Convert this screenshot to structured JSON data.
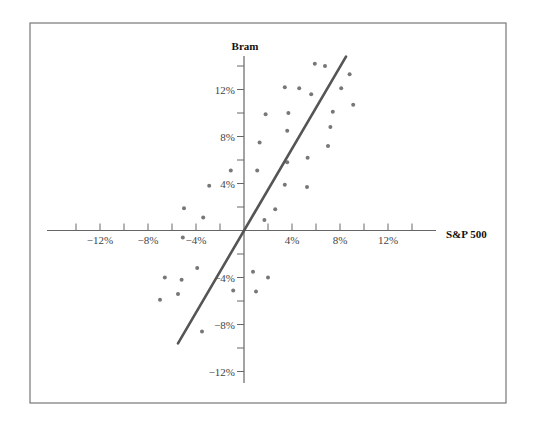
{
  "chart_data": {
    "type": "scatter",
    "title": "",
    "xlabel": "S&P 500",
    "ylabel": "Bram",
    "xlim": [
      -15.5,
      16
    ],
    "ylim": [
      -13,
      15
    ],
    "x_ticks": [
      -14,
      -12,
      -10,
      -8,
      -6,
      -4,
      -2,
      2,
      4,
      6,
      8,
      10,
      12,
      14
    ],
    "x_tick_labels": [
      {
        "value": -12,
        "label": "−12%"
      },
      {
        "value": -8,
        "label": "−8%"
      },
      {
        "value": -4,
        "label": "−4%"
      },
      {
        "value": 4,
        "label": "4%"
      },
      {
        "value": 8,
        "label": "8%"
      },
      {
        "value": 12,
        "label": "12%"
      }
    ],
    "y_ticks": [
      -12,
      -10,
      -8,
      -6,
      -4,
      -2,
      2,
      4,
      6,
      8,
      10,
      12,
      14
    ],
    "y_tick_labels": [
      {
        "value": 12,
        "label": "12%"
      },
      {
        "value": 8,
        "label": "8%"
      },
      {
        "value": 4,
        "label": "4%"
      },
      {
        "value": -4,
        "label": "−4%"
      },
      {
        "value": -8,
        "label": "−8%"
      },
      {
        "value": -12,
        "label": "−12%"
      }
    ],
    "grid": false,
    "legend": null,
    "series": [
      {
        "name": "Monthly returns",
        "type": "scatter",
        "color": "#777777",
        "points": [
          [
            5.9,
            14.2
          ],
          [
            6.75,
            14.0
          ],
          [
            8.8,
            13.3
          ],
          [
            3.4,
            12.2
          ],
          [
            4.6,
            12.1
          ],
          [
            5.6,
            11.6
          ],
          [
            8.1,
            12.1
          ],
          [
            9.1,
            10.7
          ],
          [
            1.8,
            9.9
          ],
          [
            3.7,
            10.0
          ],
          [
            7.4,
            10.1
          ],
          [
            3.6,
            8.5
          ],
          [
            7.2,
            8.8
          ],
          [
            7.0,
            7.2
          ],
          [
            1.3,
            7.5
          ],
          [
            3.6,
            5.8
          ],
          [
            5.3,
            6.2
          ],
          [
            1.1,
            5.1
          ],
          [
            3.4,
            3.9
          ],
          [
            5.25,
            3.7
          ],
          [
            2.6,
            1.8
          ],
          [
            1.7,
            0.9
          ],
          [
            -1.1,
            5.1
          ],
          [
            -2.9,
            3.8
          ],
          [
            -5.0,
            1.9
          ],
          [
            -3.4,
            1.1
          ],
          [
            -5.1,
            -0.6
          ],
          [
            -3.9,
            -3.2
          ],
          [
            -6.6,
            -4.0
          ],
          [
            -5.2,
            -4.2
          ],
          [
            -5.5,
            -5.4
          ],
          [
            -7.0,
            -5.9
          ],
          [
            -3.5,
            -8.6
          ],
          [
            0.75,
            -3.5
          ],
          [
            2.0,
            -4.0
          ],
          [
            -0.9,
            -5.1
          ],
          [
            1.0,
            -5.2
          ]
        ]
      },
      {
        "name": "Characteristic line",
        "type": "line",
        "color": "#555555",
        "points": [
          [
            -5.5,
            -9.6
          ],
          [
            8.5,
            14.8
          ]
        ]
      }
    ]
  }
}
